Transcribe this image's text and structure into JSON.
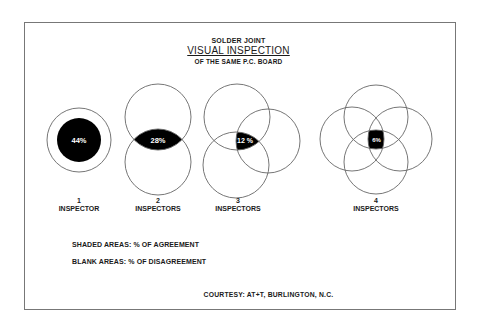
{
  "header": {
    "line1": "SOLDER JOINT",
    "line2": "VISUAL INSPECTION",
    "line3": "OF THE SAME P.C. BOARD"
  },
  "diagrams": [
    {
      "count": "1",
      "label": "INSPECTOR",
      "agreement": "44%"
    },
    {
      "count": "2",
      "label": "INSPECTORS",
      "agreement": "28%"
    },
    {
      "count": "3",
      "label": "INSPECTORS",
      "agreement": "12 %"
    },
    {
      "count": "4",
      "label": "INSPECTORS",
      "agreement": "6%"
    }
  ],
  "legend": {
    "shaded": "SHADED AREAS: % OF AGREEMENT",
    "blank": "BLANK AREAS: % OF DISAGREEMENT"
  },
  "footer": {
    "courtesy": "COURTESY: AT+T,  BURLINGTON, N.C."
  },
  "colors": {
    "ink": "#000000",
    "outline": "#666666",
    "background": "#ffffff"
  }
}
